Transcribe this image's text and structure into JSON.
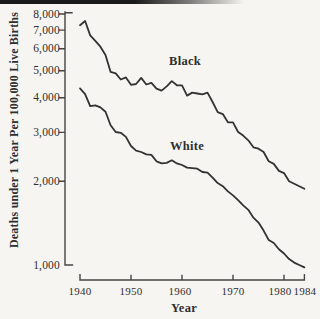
{
  "figure": {
    "background_color": "#f7f5f1",
    "ink_color": "#2f2f2f",
    "scan_edge_color": "#1a1a1a"
  },
  "chart_data": {
    "type": "line",
    "title": "",
    "xlabel": "Year",
    "ylabel": "Deaths under 1 Year Per 100,000 Live Births",
    "y_scale": "log",
    "ylim": [
      1000,
      8000
    ],
    "xlim": [
      1940,
      1984
    ],
    "grid": false,
    "legend_position": "inline-labels-on-plot",
    "y_ticks": [
      8000,
      7000,
      6000,
      5000,
      4000,
      3000,
      2000,
      1000
    ],
    "y_tick_labels": [
      "8,000",
      "7,000",
      "6,000",
      "5,000",
      "4,000",
      "3,000",
      "2,000",
      "1,000"
    ],
    "x_ticks": [
      1940,
      1950,
      1960,
      1970,
      1980,
      1984
    ],
    "x_tick_labels": [
      "1940",
      "1950",
      "1960",
      "1970",
      "1980",
      "1984"
    ],
    "x": [
      1940,
      1941,
      1942,
      1943,
      1944,
      1945,
      1946,
      1947,
      1948,
      1949,
      1950,
      1951,
      1952,
      1953,
      1954,
      1955,
      1956,
      1957,
      1958,
      1959,
      1960,
      1961,
      1962,
      1963,
      1964,
      1965,
      1966,
      1967,
      1968,
      1969,
      1970,
      1971,
      1972,
      1973,
      1974,
      1975,
      1976,
      1977,
      1978,
      1979,
      1980,
      1981,
      1982,
      1983,
      1984
    ],
    "series": [
      {
        "name": "Black",
        "label_anchor": {
          "year": 1960.6,
          "value": 5400
        },
        "values": [
          7290,
          7550,
          6700,
          6400,
          6100,
          5700,
          4950,
          4890,
          4650,
          4730,
          4450,
          4480,
          4710,
          4460,
          4520,
          4310,
          4240,
          4390,
          4590,
          4430,
          4430,
          4070,
          4170,
          4140,
          4110,
          4170,
          3860,
          3550,
          3490,
          3260,
          3260,
          3010,
          2920,
          2810,
          2650,
          2620,
          2550,
          2360,
          2310,
          2180,
          2140,
          2000,
          1960,
          1920,
          1880
        ]
      },
      {
        "name": "White",
        "label_anchor": {
          "year": 1961,
          "value": 2680
        },
        "values": [
          4320,
          4120,
          3730,
          3750,
          3690,
          3560,
          3180,
          3010,
          2990,
          2890,
          2680,
          2580,
          2550,
          2500,
          2490,
          2360,
          2320,
          2330,
          2380,
          2320,
          2290,
          2240,
          2230,
          2220,
          2160,
          2150,
          2060,
          1970,
          1920,
          1840,
          1780,
          1710,
          1640,
          1580,
          1480,
          1420,
          1330,
          1230,
          1200,
          1140,
          1100,
          1050,
          1020,
          1000,
          980
        ]
      }
    ]
  }
}
